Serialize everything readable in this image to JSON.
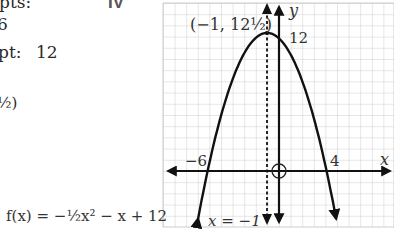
{
  "left_notes": {
    "line1": "pts:",
    "line2": "6",
    "line3_label": "pt:",
    "line3_value": "12",
    "line4": "½)"
  },
  "section_label": "IV",
  "equation_label": "f(x) = −½x² − x + 12",
  "vertex_label": "(−1, 12½)",
  "axis_of_symmetry_label": "x = −1",
  "chart_data": {
    "type": "line",
    "title": "",
    "function": "f(x) = -1/2 x^2 - x + 12",
    "xlabel": "x",
    "ylabel": "y",
    "grid": true,
    "xlim": [
      -9.8,
      9.6
    ],
    "ylim": [
      -5,
      14.9
    ],
    "series": [
      {
        "name": "f(x)",
        "x": [
          -6.8,
          -6,
          -5,
          -4,
          -3,
          -2,
          -1,
          0,
          1,
          2,
          3,
          4,
          4.8
        ],
        "y": [
          -4.32,
          0,
          4.5,
          8,
          10.5,
          12,
          12.5,
          12,
          10.5,
          8,
          4.5,
          0,
          -4.32
        ]
      }
    ],
    "annotations": [
      {
        "text": "(−1, 12½)",
        "x": -1,
        "y": 12.5,
        "kind": "vertex"
      },
      {
        "text": "12",
        "x": 0,
        "y": 12,
        "kind": "y-intercept"
      },
      {
        "text": "−6",
        "x": -6,
        "y": 0,
        "kind": "x-intercept"
      },
      {
        "text": "4",
        "x": 4,
        "y": 0,
        "kind": "x-intercept"
      },
      {
        "text": "x = −1",
        "kind": "axis-of-symmetry (dashed)"
      }
    ],
    "tick_labels": {
      "x": [
        "−6",
        "4"
      ],
      "y": [
        "12"
      ]
    }
  }
}
